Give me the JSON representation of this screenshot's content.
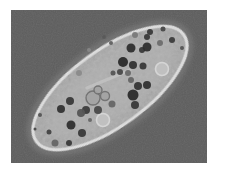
{
  "image": {
    "semantic_name": "paramecium-phase-contrast-micrograph"
  },
  "palette": {
    "page_bg": "#ffffff",
    "photo_bg": "#5d5d5d",
    "cilia_halo": "#888888",
    "cell_body": "#a9a9a9",
    "cell_inner_highlight": "#b6b6b6",
    "cell_rim": "#dcdcdc",
    "oral_groove": "#c4c4c4",
    "vacuole_ring_stroke": "#6e6e6e",
    "vacuole_ring_fill": "#a4a4a4",
    "vacuole_bright_fill": "#c2c2c2",
    "vacuole_bright_stroke": "#dadada"
  },
  "cell": {
    "granules": [
      {
        "x": 131,
        "y": 48,
        "r": 4.5,
        "fill": "#303030"
      },
      {
        "x": 142,
        "y": 50,
        "r": 3,
        "fill": "#3a3a3a"
      },
      {
        "x": 147,
        "y": 37,
        "r": 3,
        "fill": "#383838"
      },
      {
        "x": 147,
        "y": 47,
        "r": 4.5,
        "fill": "#2e2e2e"
      },
      {
        "x": 123,
        "y": 62,
        "r": 5,
        "fill": "#2b2b2b"
      },
      {
        "x": 133,
        "y": 65,
        "r": 4,
        "fill": "#333333"
      },
      {
        "x": 143,
        "y": 66,
        "r": 3.5,
        "fill": "#383838"
      },
      {
        "x": 120,
        "y": 72,
        "r": 3,
        "fill": "#4a4a4a"
      },
      {
        "x": 128,
        "y": 73,
        "r": 3,
        "fill": "#6a6a6a"
      },
      {
        "x": 113,
        "y": 73,
        "r": 2.5,
        "fill": "#555555"
      },
      {
        "x": 135,
        "y": 35,
        "r": 3,
        "fill": "#7a7a7a"
      },
      {
        "x": 150,
        "y": 32,
        "r": 3,
        "fill": "#3a3a3a"
      },
      {
        "x": 163,
        "y": 29,
        "r": 2.5,
        "fill": "#484848"
      },
      {
        "x": 172,
        "y": 40,
        "r": 3,
        "fill": "#3c3c3c"
      },
      {
        "x": 160,
        "y": 43,
        "r": 3,
        "fill": "#6e6e6e"
      },
      {
        "x": 182,
        "y": 48,
        "r": 2,
        "fill": "#555555"
      },
      {
        "x": 104,
        "y": 37,
        "r": 2,
        "fill": "#5a5a5a"
      },
      {
        "x": 111,
        "y": 43,
        "r": 2,
        "fill": "#606060"
      },
      {
        "x": 131,
        "y": 80,
        "r": 3,
        "fill": "#666666"
      },
      {
        "x": 133,
        "y": 95,
        "r": 5.5,
        "fill": "#2b2b2b"
      },
      {
        "x": 138,
        "y": 86,
        "r": 4,
        "fill": "#363636"
      },
      {
        "x": 147,
        "y": 85,
        "r": 4,
        "fill": "#333333"
      },
      {
        "x": 135,
        "y": 105,
        "r": 4,
        "fill": "#383838"
      },
      {
        "x": 86,
        "y": 110,
        "r": 4,
        "fill": "#3d3d3d"
      },
      {
        "x": 98,
        "y": 110,
        "r": 4,
        "fill": "#4a4a4a"
      },
      {
        "x": 112,
        "y": 104,
        "r": 3.5,
        "fill": "#666666"
      },
      {
        "x": 70,
        "y": 101,
        "r": 4,
        "fill": "#383838"
      },
      {
        "x": 61,
        "y": 109,
        "r": 4,
        "fill": "#333333"
      },
      {
        "x": 81,
        "y": 113,
        "r": 4,
        "fill": "#555555"
      },
      {
        "x": 71,
        "y": 125,
        "r": 4.5,
        "fill": "#2f2f2f"
      },
      {
        "x": 82,
        "y": 133,
        "r": 4,
        "fill": "#3a3a3a"
      },
      {
        "x": 49,
        "y": 132,
        "r": 2.5,
        "fill": "#444444"
      },
      {
        "x": 55,
        "y": 143,
        "r": 3.5,
        "fill": "#666666"
      },
      {
        "x": 69,
        "y": 143,
        "r": 3,
        "fill": "#3a3a3a"
      },
      {
        "x": 40,
        "y": 115,
        "r": 2,
        "fill": "#555555"
      },
      {
        "x": 35,
        "y": 129,
        "r": 1.5,
        "fill": "#4a4a4a"
      },
      {
        "x": 90,
        "y": 120,
        "r": 2,
        "fill": "#666666"
      },
      {
        "x": 79,
        "y": 73,
        "r": 3,
        "fill": "#8a8a8a"
      },
      {
        "x": 89,
        "y": 50,
        "r": 2,
        "fill": "#888888"
      }
    ],
    "ring_vacuoles": [
      {
        "x": 93,
        "y": 98,
        "r": 7
      },
      {
        "x": 105,
        "y": 96,
        "r": 4.5
      },
      {
        "x": 98,
        "y": 90,
        "r": 4
      }
    ],
    "bright_vacuoles": [
      {
        "x": 162,
        "y": 69,
        "r": 6.5
      },
      {
        "x": 103,
        "y": 120,
        "r": 6.5
      }
    ]
  }
}
